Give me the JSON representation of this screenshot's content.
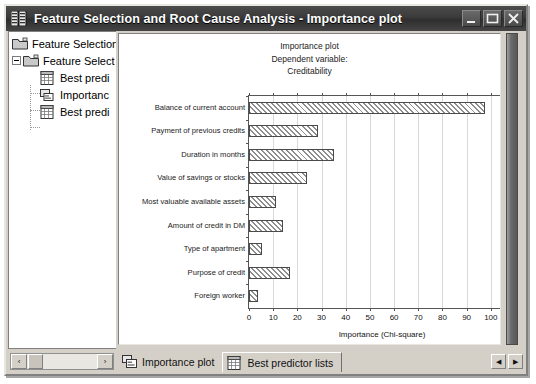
{
  "window": {
    "title": "Feature Selection and Root Cause Analysis - Importance plot",
    "icon": "spreadsheet-icon",
    "buttons": {
      "minimize": "Minimize",
      "maximize": "Maximize",
      "close": "Close"
    }
  },
  "tree": {
    "items": [
      {
        "label": "Feature Selection",
        "icon": "folder-icon",
        "indent": 0,
        "expander": false
      },
      {
        "label": "Feature Select",
        "icon": "folder-icon",
        "indent": 1,
        "expander": true
      },
      {
        "label": "Best predi",
        "icon": "grid-document-icon",
        "indent": 2,
        "expander": false
      },
      {
        "label": "Importanc",
        "icon": "chart-document-icon",
        "indent": 2,
        "expander": false
      },
      {
        "label": "Best predi",
        "icon": "grid-document-icon",
        "indent": 2,
        "expander": false
      }
    ]
  },
  "chart_data": {
    "type": "bar",
    "orientation": "horizontal",
    "title": "Importance plot",
    "subtitle_line1": "Dependent variable:",
    "subtitle_line2": "Creditability",
    "xlabel": "Importance (Chi-square)",
    "ylabel": "",
    "xlim": [
      0,
      110
    ],
    "xticks": [
      0,
      10,
      20,
      30,
      40,
      50,
      60,
      70,
      80,
      90,
      100,
      110
    ],
    "grid": true,
    "legend": false,
    "categories": [
      "Balance of current account",
      "Payment of previous credits",
      "Duration in months",
      "Value of savings or stocks",
      "Most valuable available assets",
      "Amount of credit in DM",
      "Type of apartment",
      "Purpose of credit",
      "Foreign worker"
    ],
    "values": [
      97.4,
      28.4,
      35.0,
      24.0,
      11.3,
      14.1,
      5.5,
      16.8,
      3.6
    ],
    "bar_fill": "hatched-diagonal",
    "bar_border": "#4a4a4a"
  },
  "bottom": {
    "scroll_left_arrow": "‹",
    "scroll_right_arrow": "›",
    "tabs": [
      {
        "label": "Importance plot",
        "icon": "chart-document-icon",
        "active": true
      },
      {
        "label": "Best predictor lists",
        "icon": "grid-document-icon",
        "active": false
      }
    ],
    "nav_left": "◀",
    "nav_right": "▶"
  },
  "colors": {
    "titlebar": "#3a3a3a",
    "face": "#d4d0c8",
    "plot_bg": "#ffffff",
    "grid": "#d8d8d8"
  }
}
